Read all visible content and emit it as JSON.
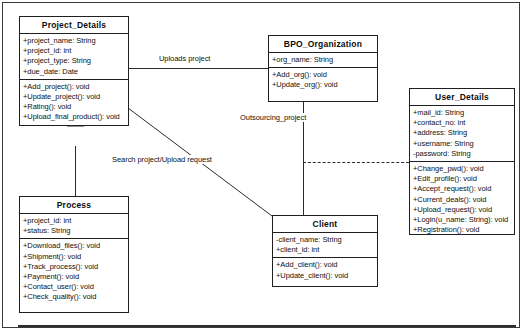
{
  "diagram": {
    "type": "uml-class-diagram",
    "classes": [
      {
        "id": "project_details",
        "name": "Project_Details",
        "attributes": [
          "+project_name: String",
          "+project_id: int",
          "+project_type: String",
          "+due_date: Date"
        ],
        "methods": [
          "+Add_project(): void",
          "+Update_project(): void",
          "+Rating(): void",
          "+Upload_final_product(): void"
        ]
      },
      {
        "id": "bpo_organization",
        "name": "BPO_Organization",
        "attributes": [
          "+org_name: String"
        ],
        "methods": [
          "+Add_org(): void",
          "+Update_org(): void"
        ]
      },
      {
        "id": "user_details",
        "name": "User_Details",
        "attributes": [
          "+mail_id: String",
          "+contact_no: int",
          "+address: String",
          "+username: String",
          "-password: String"
        ],
        "methods": [
          "+Change_pwd(): void",
          "+Edit_profile(): void",
          "+Accept_request(): void",
          "+Current_deals(): void",
          "+Upload_request(): void",
          "+Login(u_name: String): void",
          "+Registration(): void"
        ]
      },
      {
        "id": "process",
        "name": "Process",
        "attributes": [
          "+project_id: int",
          "+status: String"
        ],
        "methods": [
          "+Download_files(): void",
          "+Shipment(): void",
          "+Track_process(): void",
          "+Payment(): void",
          "+Contact_user(): void",
          "+Check_quality(): void"
        ]
      },
      {
        "id": "client",
        "name": "Client",
        "attributes": [
          "-client_name: String",
          "+client_id: int"
        ],
        "methods": [
          "+Add_client(): void",
          "+Update_client(): void"
        ]
      }
    ],
    "relationships": [
      {
        "id": "uploads_project",
        "label": "Uploads project",
        "from": "project_details",
        "to": "bpo_organization",
        "style": "solid"
      },
      {
        "id": "outsourcing_project",
        "label": "Outsourcing_project",
        "from": "bpo_organization",
        "to": "client",
        "style": "solid"
      },
      {
        "id": "search_upload",
        "label": "Search project/Upload request",
        "from": "project_details",
        "to": "client",
        "style": "solid"
      },
      {
        "id": "client_user",
        "label": "",
        "from": "client",
        "to": "user_details",
        "style": "dashed"
      },
      {
        "id": "process_generalization",
        "label": "",
        "from": "process",
        "to": "project_details",
        "style": "generalization"
      }
    ],
    "colors": {
      "line": "#2b2b2b",
      "box_border": "#1f1f1f",
      "text": "#111111",
      "background": "#ffffff",
      "frame": "#3a3a3a"
    }
  }
}
